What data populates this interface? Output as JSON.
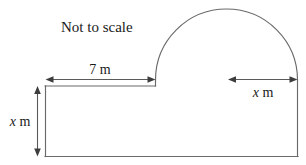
{
  "figure": {
    "note_label": "Not to scale",
    "top_width_label": "7 m",
    "radius_label_variable": "x",
    "radius_label_unit": " m",
    "height_label_variable": "x",
    "height_label_unit": " m",
    "colors": {
      "outline": "#6a6a6a",
      "dimension": "#5a5a5a",
      "text": "#1a1a1a",
      "background": "#ffffff"
    },
    "shape": {
      "type": "rectangle-with-semicircle",
      "rectangle": {
        "left": 45,
        "top": 86,
        "right": 298,
        "bottom": 157
      },
      "semicircle": {
        "center_x": 227,
        "base_y": 80,
        "radius": 71.5,
        "apex_y": 8
      }
    },
    "dimensions": [
      {
        "name": "top-width",
        "label": "7 m",
        "orientation": "horizontal",
        "from_x": 46,
        "to_x": 155,
        "y": 79
      },
      {
        "name": "semicircle-radius",
        "label": "x m",
        "orientation": "horizontal",
        "from_x": 228,
        "to_x": 298,
        "y": 79
      },
      {
        "name": "rectangle-height",
        "label": "x m",
        "orientation": "vertical",
        "x": 37,
        "from_y": 86,
        "to_y": 156
      }
    ]
  }
}
